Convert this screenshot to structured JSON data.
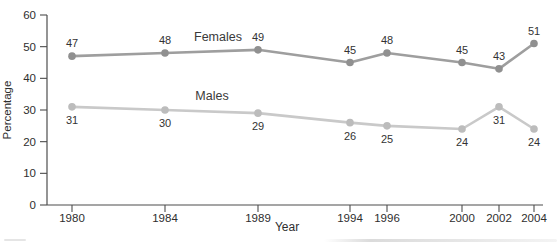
{
  "chart_data": {
    "type": "line",
    "categories": [
      "1980",
      "1984",
      "1989",
      "1994",
      "1996",
      "2000",
      "2002",
      "2004"
    ],
    "series": [
      {
        "name": "Females",
        "values": [
          47,
          48,
          49,
          45,
          48,
          45,
          43,
          51
        ],
        "color": "#9e9e9e",
        "marker_color": "#909090",
        "value_label_position": "above",
        "name_label": {
          "x": 218,
          "y": 41
        }
      },
      {
        "name": "Males",
        "values": [
          31,
          30,
          29,
          26,
          25,
          24,
          31,
          24
        ],
        "color": "#c9c9c9",
        "marker_color": "#bcbcbc",
        "value_label_position": "below",
        "name_label": {
          "x": 212,
          "y": 100
        }
      }
    ],
    "xlabel": "Year",
    "ylabel": "Percentage",
    "ylim": [
      0,
      60
    ],
    "yticks": [
      0,
      10,
      20,
      30,
      40,
      50,
      60
    ],
    "grid": false,
    "legend": "inline-labels",
    "layout": {
      "x_positions_px": [
        72,
        165,
        258,
        350,
        387,
        462,
        499,
        534
      ],
      "plot": {
        "x0": 47,
        "y0": 205,
        "y_top": 15,
        "x_right": 543
      },
      "tick_len": 7,
      "axis_color": "#4d4d4d",
      "line_width": 2.6,
      "marker_radius": 3.8,
      "value_label_dy_above": -9,
      "value_label_dy_below": 17,
      "xlabel_pos": {
        "x": 287,
        "y": 231
      },
      "ylabel_pos": {
        "x": 11,
        "y": 110
      }
    }
  }
}
